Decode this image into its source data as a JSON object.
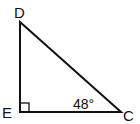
{
  "diagram": {
    "type": "right-triangle",
    "vertices": {
      "D": {
        "label": "D",
        "x": 20,
        "y": 22
      },
      "E": {
        "label": "E",
        "x": 20,
        "y": 112
      },
      "C": {
        "label": "C",
        "x": 121,
        "y": 112
      }
    },
    "right_angle_at": "E",
    "angle_label": {
      "vertex": "C",
      "text": "48°"
    },
    "colors": {
      "stroke": "#111111",
      "background": "#ffffff"
    }
  }
}
